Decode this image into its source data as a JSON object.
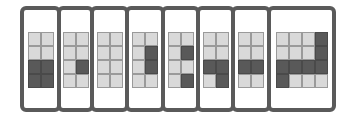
{
  "diagram": {
    "colors": {
      "frame": "#5a5a5a",
      "light_cell": "#d9d9d9",
      "dark_cell": "#595959",
      "background": "#ffffff"
    },
    "panels": [
      {
        "id": 1,
        "left": 0,
        "width": 41,
        "cols": 2,
        "cells": [
          [
            "L",
            "L"
          ],
          [
            "L",
            "L"
          ],
          [
            "D",
            "D"
          ],
          [
            "D",
            "D"
          ]
        ]
      },
      {
        "id": 2,
        "left": 37,
        "width": 37,
        "cols": 2,
        "cells": [
          [
            "L",
            "L"
          ],
          [
            "L",
            "L"
          ],
          [
            "L",
            "D"
          ],
          [
            "L",
            "L"
          ]
        ]
      },
      {
        "id": 3,
        "left": 70,
        "width": 39,
        "cols": 2,
        "cells": [
          [
            "L",
            "L"
          ],
          [
            "L",
            "L"
          ],
          [
            "L",
            "L"
          ],
          [
            "L",
            "L"
          ]
        ]
      },
      {
        "id": 4,
        "left": 105,
        "width": 40,
        "cols": 2,
        "cells": [
          [
            "L",
            "L"
          ],
          [
            "L",
            "D"
          ],
          [
            "L",
            "D"
          ],
          [
            "L",
            "L"
          ]
        ]
      },
      {
        "id": 5,
        "left": 141,
        "width": 39,
        "cols": 2,
        "cells": [
          [
            "L",
            "L"
          ],
          [
            "L",
            "D"
          ],
          [
            "L",
            "L"
          ],
          [
            "L",
            "D"
          ]
        ]
      },
      {
        "id": 6,
        "left": 176,
        "width": 39,
        "cols": 2,
        "cells": [
          [
            "L",
            "L"
          ],
          [
            "L",
            "L"
          ],
          [
            "D",
            "D"
          ],
          [
            "L",
            "D"
          ]
        ]
      },
      {
        "id": 7,
        "left": 211,
        "width": 40,
        "cols": 2,
        "cells": [
          [
            "L",
            "L"
          ],
          [
            "L",
            "L"
          ],
          [
            "D",
            "D"
          ],
          [
            "L",
            "L"
          ]
        ]
      },
      {
        "id": 8,
        "left": 247,
        "width": 69,
        "cols": 4,
        "cells": [
          [
            "L",
            "L",
            "L",
            "D"
          ],
          [
            "L",
            "L",
            "L",
            "D"
          ],
          [
            "D",
            "D",
            "D",
            "D"
          ],
          [
            "D",
            "L",
            "L",
            "L"
          ]
        ]
      }
    ]
  }
}
